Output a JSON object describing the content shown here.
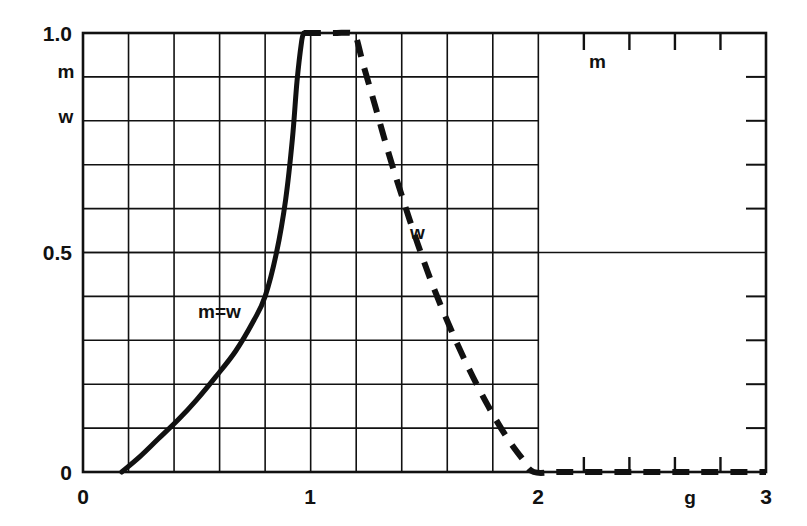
{
  "chart_data": {
    "type": "line",
    "title": "",
    "xlabel": "g",
    "ylabel": "m w",
    "xlim": [
      0,
      3
    ],
    "ylim": [
      0,
      1.0
    ],
    "grid": true,
    "grid_region_x": [
      0,
      2
    ],
    "grid_x_step": 0.2,
    "grid_y_step": 0.1,
    "xticks": [
      "0",
      "1",
      "2",
      "3"
    ],
    "xtick_values": [
      0,
      1,
      2,
      3
    ],
    "yticks": [
      "0",
      "0.5",
      "1.0"
    ],
    "ytick_values": [
      0,
      0.5,
      1.0
    ],
    "legend_position": "inline-annotations",
    "annotations": [
      {
        "text": "m=w",
        "x": 0.62,
        "y": 0.42
      },
      {
        "text": "w",
        "x": 1.39,
        "y": 0.52
      },
      {
        "text": "m",
        "x": 2.27,
        "y": 0.93
      }
    ],
    "series": [
      {
        "name": "m=w",
        "style": "solid",
        "color": "#111111",
        "points": [
          [
            0.17,
            0.0
          ],
          [
            0.25,
            0.035
          ],
          [
            0.33,
            0.075
          ],
          [
            0.42,
            0.12
          ],
          [
            0.5,
            0.165
          ],
          [
            0.58,
            0.215
          ],
          [
            0.67,
            0.275
          ],
          [
            0.75,
            0.345
          ],
          [
            0.8,
            0.4
          ],
          [
            0.85,
            0.5
          ],
          [
            0.89,
            0.62
          ],
          [
            0.92,
            0.76
          ],
          [
            0.94,
            0.89
          ],
          [
            0.96,
            0.98
          ],
          [
            0.97,
            1.0
          ]
        ]
      },
      {
        "name": "w",
        "style": "dashed",
        "color": "#111111",
        "points": [
          [
            0.97,
            1.0
          ],
          [
            1.1,
            1.0
          ],
          [
            1.18,
            1.0
          ],
          [
            1.2,
            0.99
          ],
          [
            1.23,
            0.93
          ],
          [
            1.28,
            0.84
          ],
          [
            1.34,
            0.73
          ],
          [
            1.4,
            0.63
          ],
          [
            1.47,
            0.52
          ],
          [
            1.54,
            0.42
          ],
          [
            1.62,
            0.32
          ],
          [
            1.7,
            0.23
          ],
          [
            1.78,
            0.15
          ],
          [
            1.86,
            0.08
          ],
          [
            1.93,
            0.03
          ],
          [
            1.98,
            0.0
          ],
          [
            2.1,
            0.0
          ],
          [
            2.4,
            0.0
          ],
          [
            2.7,
            0.0
          ],
          [
            3.0,
            0.0
          ]
        ]
      }
    ]
  },
  "axis_labels": {
    "y_top": "1.0",
    "y_mid": "0.5",
    "y_zero": "0",
    "y_name_m": "m",
    "y_name_w": "w",
    "x_zero": "0",
    "x_one": "1",
    "x_two": "2",
    "x_three": "3",
    "x_name": "g"
  },
  "curve_labels": {
    "solid": "m=w",
    "dashed_w": "w",
    "dashed_m": "m"
  }
}
